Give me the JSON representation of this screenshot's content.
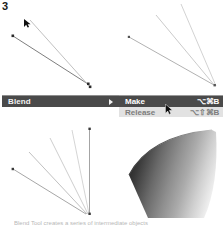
{
  "figure": {
    "step_number": "3",
    "caption": "Blend Tool creates a series of intermediate objects"
  },
  "menu": {
    "parent_label": "Blend",
    "submenu_arrow_icon": "triangle-right-icon",
    "items": [
      {
        "label": "Make",
        "shortcut": "⌥⌘B",
        "selected": true
      },
      {
        "label": "Release",
        "shortcut": "⌥⇧⌘B",
        "selected": false
      }
    ]
  },
  "cursors": {
    "menu_cursor_icon": "arrow-pointer-icon",
    "artboard_cursor_icon": "arrow-pointer-icon"
  },
  "artwork": {
    "top_left": {
      "name": "two-selected-paths",
      "description": "Two nearly parallel straight paths selected before blending",
      "paths": [
        {
          "x1": 9,
          "y1": 28,
          "x2": 84,
          "y2": 76
        },
        {
          "x1": 26,
          "y1": 12,
          "x2": 86,
          "y2": 79
        }
      ]
    },
    "top_right": {
      "name": "three-paths-fan",
      "description": "Three paths converging to a common point at lower right",
      "paths": [
        {
          "x1": 5,
          "y1": 33,
          "x2": 90,
          "y2": 81
        },
        {
          "x1": 32,
          "y1": 11,
          "x2": 91,
          "y2": 82
        },
        {
          "x1": 56,
          "y1": 0,
          "x2": 92,
          "y2": 82
        }
      ]
    },
    "bottom_left": {
      "name": "blended-fan-paths",
      "description": "Five blended intermediate paths fanning from a convergence point",
      "paths": [
        {
          "x1": 8,
          "y1": 43,
          "x2": 82,
          "y2": 88
        },
        {
          "x1": 24,
          "y1": 26,
          "x2": 83,
          "y2": 88
        },
        {
          "x1": 45,
          "y1": 12,
          "x2": 84,
          "y2": 88
        },
        {
          "x1": 68,
          "y1": 4,
          "x2": 85,
          "y2": 88
        },
        {
          "x1": 85,
          "y1": 3,
          "x2": 85,
          "y2": 88
        }
      ]
    },
    "bottom_right": {
      "name": "blended-gradient-cone",
      "description": "Dense blend rendered as a shaded cone / fan with gradient",
      "gradient_from": "#2b2b2b",
      "gradient_to": "#f0f0f0"
    }
  },
  "colors": {
    "menu_bar_bg": "#4a4a4a",
    "submenu_bg": "#e2e2e2",
    "menu_text": "#f2f2f2",
    "disabled_text": "#7d7d7d",
    "page_bg": "#ffffff"
  }
}
